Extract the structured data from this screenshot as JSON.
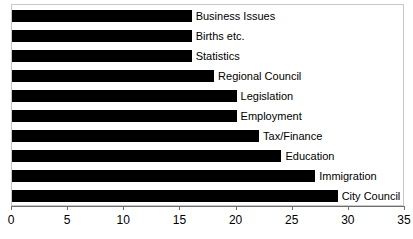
{
  "chart_data": {
    "type": "bar",
    "orientation": "horizontal",
    "title": "",
    "xlabel": "",
    "ylabel": "",
    "xlim": [
      0,
      35
    ],
    "xticks": [
      0,
      5,
      10,
      15,
      20,
      25,
      30,
      35
    ],
    "grid": false,
    "legend": "none",
    "bar_color": "#000000",
    "frame_color": "#c8c8c8",
    "axis_color": "#6e6e6e",
    "categories": [
      "Business Issues",
      "Births etc.",
      "Statistics",
      "Regional Council",
      "Legislation",
      "Employment",
      "Tax/Finance",
      "Education",
      "Immigration",
      "City Council"
    ],
    "values": [
      16,
      16,
      16,
      18,
      20,
      20,
      22,
      24,
      27,
      29
    ],
    "bars": [
      {
        "label": "Business Issues",
        "value": 16
      },
      {
        "label": "Births etc.",
        "value": 16
      },
      {
        "label": "Statistics",
        "value": 16
      },
      {
        "label": "Regional Council",
        "value": 18
      },
      {
        "label": "Legislation",
        "value": 20
      },
      {
        "label": "Employment",
        "value": 20
      },
      {
        "label": "Tax/Finance",
        "value": 22
      },
      {
        "label": "Education",
        "value": 24
      },
      {
        "label": "Immigration",
        "value": 27
      },
      {
        "label": "City Council",
        "value": 29
      }
    ],
    "tick_labels": [
      "0",
      "5",
      "10",
      "15",
      "20",
      "25",
      "30",
      "35"
    ]
  }
}
